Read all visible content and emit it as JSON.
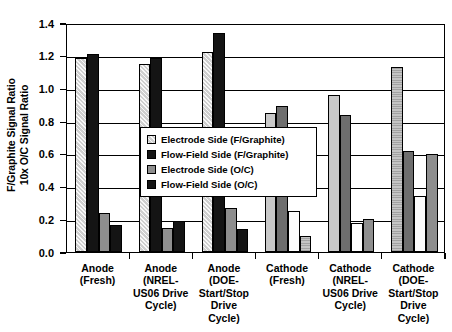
{
  "chart_data": {
    "type": "bar",
    "title": "",
    "xlabel": "",
    "ylabel": "F/Graphite Signal Ratio\n10x O/C Signal Ratio",
    "ylim": [
      0.0,
      1.4
    ],
    "yticks": [
      "0.0",
      "0.2",
      "0.4",
      "0.6",
      "0.8",
      "1.0",
      "1.2",
      "1.4"
    ],
    "ytick_values": [
      0.0,
      0.2,
      0.4,
      0.6,
      0.8,
      1.0,
      1.2,
      1.4
    ],
    "grid": true,
    "legend_position": "center",
    "categories": [
      "Anode\n(Fresh)",
      "Anode\n(NREL-\nUS06 Drive\nCycle)",
      "Anode\n(DOE-\nStart/Stop\nDrive\nCycle)",
      "Cathode\n(Fresh)",
      "Cathode\n(NREL-\nUS06 Drive\nCycle)",
      "Cathode\n(DOE-\nStart/Stop\nDrive\nCycle)"
    ],
    "series": [
      {
        "name": "Electrode Side (F/Graphite)",
        "swatch": "f-hatch-light",
        "values": [
          1.185,
          1.15,
          1.22,
          0.85,
          0.96,
          1.13
        ]
      },
      {
        "name": "Flow-Field Side (F/Graphite)",
        "swatch": "f-black",
        "values": [
          1.21,
          1.185,
          1.34,
          0.89,
          0.835,
          0.62
        ]
      },
      {
        "name": "Electrode Side (O/C)",
        "swatch": "f-midgray",
        "values": [
          0.24,
          0.145,
          0.27,
          0.25,
          0.175,
          0.34
        ]
      },
      {
        "name": "Flow-Field Side (O/C)",
        "swatch": "f-black",
        "values": [
          0.165,
          0.19,
          0.14,
          0.095,
          0.2,
          0.6
        ]
      }
    ],
    "bar_fill_overrides": {
      "3": [
        "f-lightgray",
        "f-darkgray",
        "f-white",
        "f-gray-dot"
      ],
      "4": [
        "f-lightgray",
        "f-darkgray",
        "f-white",
        "f-midgray"
      ],
      "5": [
        "f-gray-dot",
        "f-darkgray",
        "f-white",
        "f-midgray"
      ]
    }
  },
  "legend": {
    "items": [
      {
        "label": "Electrode Side (F/Graphite)",
        "swatch": "f-hatch-light"
      },
      {
        "label": "Flow-Field Side (F/Graphite)",
        "swatch": "f-black"
      },
      {
        "label": "Electrode Side (O/C)",
        "swatch": "f-midgray"
      },
      {
        "label": "Flow-Field Side (O/C)",
        "swatch": "f-black"
      }
    ]
  }
}
